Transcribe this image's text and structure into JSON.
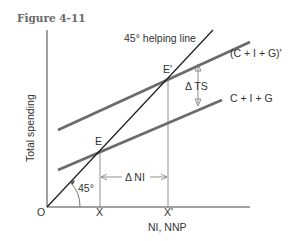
{
  "figure": {
    "title": "Figure 4-11"
  },
  "axes": {
    "y_label": "Total spending",
    "x_label": "NI, NNP",
    "origin_label": "O",
    "x_ticks": [
      "X",
      "X'"
    ]
  },
  "lines": {
    "helping_line": "45° helping line",
    "upper_curve": "(C + I + G)'",
    "lower_curve": "C + I + G",
    "angle_label": "45°"
  },
  "points": {
    "e": "E",
    "e_prime": "E'"
  },
  "annotations": {
    "delta_ts": "Δ TS",
    "delta_ni": "Δ NI"
  },
  "colors": {
    "curve": "#6b6b6b",
    "axis": "#444444",
    "helping_line": "#1a1a1a"
  }
}
